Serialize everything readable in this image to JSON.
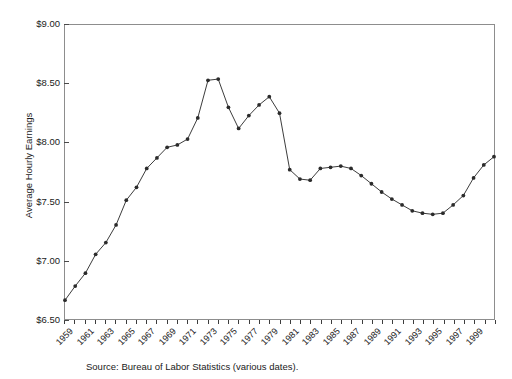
{
  "figure": {
    "clipped_header_text": "",
    "source_note": "Source: Bureau of Labor Statistics (various dates)."
  },
  "chart_data": {
    "type": "line",
    "title": "",
    "xlabel": "",
    "ylabel": "Average Hourly Earnings",
    "ylim": [
      6.5,
      9.0
    ],
    "xlim": [
      1959,
      2001
    ],
    "ytick_labels": [
      "$9.00",
      "$8.50",
      "$8.00",
      "$7.50",
      "$7.00",
      "$6.50"
    ],
    "ytick_values": [
      9.0,
      8.5,
      8.0,
      7.5,
      7.0,
      6.5
    ],
    "xtick_labels": [
      "1959",
      "1961",
      "1963",
      "1965",
      "1967",
      "1969",
      "1971",
      "1973",
      "1975",
      "1977",
      "1979",
      "1981",
      "1983",
      "1985",
      "1987",
      "1989",
      "1991",
      "1993",
      "1995",
      "1997",
      "1999"
    ],
    "grid": false,
    "legend": false,
    "marker": "filled-circle",
    "line_color": "#3a3a3a",
    "marker_color": "#2b2b2b",
    "x": [
      1959,
      1960,
      1961,
      1962,
      1963,
      1964,
      1965,
      1966,
      1967,
      1968,
      1969,
      1970,
      1971,
      1972,
      1973,
      1974,
      1975,
      1976,
      1977,
      1978,
      1979,
      1980,
      1981,
      1982,
      1983,
      1984,
      1985,
      1986,
      1987,
      1988,
      1989,
      1990,
      1991,
      1992,
      1993,
      1994,
      1995,
      1996,
      1997,
      1998,
      1999,
      2000,
      2001
    ],
    "values": [
      6.66,
      6.78,
      6.89,
      7.05,
      7.15,
      7.3,
      7.51,
      7.62,
      7.78,
      7.87,
      7.96,
      7.98,
      8.03,
      8.21,
      8.53,
      8.54,
      8.3,
      8.12,
      8.23,
      8.32,
      8.39,
      8.25,
      7.77,
      7.69,
      7.68,
      7.78,
      7.79,
      7.8,
      7.78,
      7.72,
      7.65,
      7.58,
      7.52,
      7.47,
      7.42,
      7.4,
      7.39,
      7.4,
      7.47,
      7.55,
      7.7,
      7.81,
      7.88
    ]
  }
}
